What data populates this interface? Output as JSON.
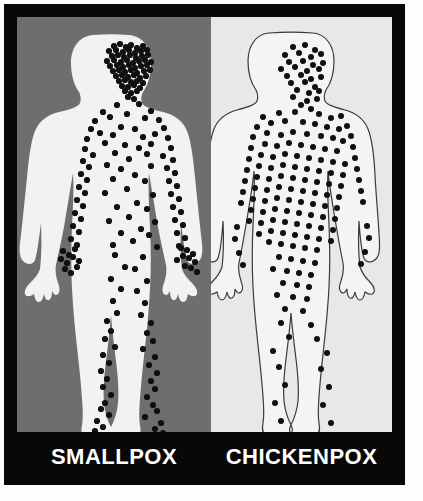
{
  "figure": {
    "type": "comparison-illustration",
    "title_visible": false,
    "panels": [
      {
        "id": "smallpox",
        "label": "SMALLPOX",
        "background_color": "#6e6e6e",
        "body_fill": "#f2f2f2",
        "body_stroke": "none",
        "spot_color": "#101010",
        "rash_distribution": "centrifugal - dense on face, hands, lower legs and feet; sparser on trunk",
        "spot_count": 186
      },
      {
        "id": "chickenpox",
        "label": "CHICKENPOX",
        "background_color": "#e8e8e8",
        "body_fill": "#f4f4f4",
        "body_stroke": "#3a3a3a",
        "spot_color": "#101010",
        "rash_distribution": "centripetal - dense on trunk and face; sparse on limbs, almost none on hands and feet",
        "spot_count": 151
      }
    ],
    "frame_color": "#080808",
    "label_text_color": "#ffffff",
    "outer_background": "#ffffff"
  },
  "chart_data": {
    "type": "table",
    "categories": [
      "Head/Face",
      "Trunk",
      "Arms",
      "Hands",
      "Legs",
      "Feet"
    ],
    "series": [
      {
        "name": "SMALLPOX",
        "values": [
          48,
          34,
          40,
          26,
          30,
          18
        ]
      },
      {
        "name": "CHICKENPOX",
        "values": [
          30,
          96,
          14,
          4,
          6,
          1
        ]
      }
    ],
    "xlabel": "Body region",
    "ylabel": "Number of lesions depicted",
    "legend": [
      "SMALLPOX",
      "CHICKENPOX"
    ]
  },
  "smallpox_spots": [
    [
      97,
      29
    ],
    [
      103,
      27
    ],
    [
      109,
      30
    ],
    [
      114,
      28
    ],
    [
      120,
      31
    ],
    [
      126,
      29
    ],
    [
      92,
      34
    ],
    [
      99,
      33
    ],
    [
      106,
      35
    ],
    [
      112,
      33
    ],
    [
      118,
      36
    ],
    [
      124,
      34
    ],
    [
      130,
      33
    ],
    [
      95,
      39
    ],
    [
      101,
      38
    ],
    [
      107,
      40
    ],
    [
      113,
      38
    ],
    [
      119,
      41
    ],
    [
      125,
      39
    ],
    [
      131,
      38
    ],
    [
      90,
      44
    ],
    [
      97,
      43
    ],
    [
      104,
      45
    ],
    [
      110,
      43
    ],
    [
      116,
      46
    ],
    [
      122,
      44
    ],
    [
      128,
      43
    ],
    [
      134,
      45
    ],
    [
      93,
      49
    ],
    [
      100,
      48
    ],
    [
      106,
      50
    ],
    [
      112,
      48
    ],
    [
      118,
      51
    ],
    [
      124,
      49
    ],
    [
      130,
      48
    ],
    [
      96,
      54
    ],
    [
      102,
      53
    ],
    [
      108,
      55
    ],
    [
      114,
      53
    ],
    [
      120,
      56
    ],
    [
      127,
      54
    ],
    [
      133,
      53
    ],
    [
      99,
      59
    ],
    [
      105,
      58
    ],
    [
      111,
      60
    ],
    [
      117,
      58
    ],
    [
      123,
      61
    ],
    [
      129,
      59
    ],
    [
      102,
      64
    ],
    [
      108,
      63
    ],
    [
      114,
      65
    ],
    [
      120,
      64
    ],
    [
      126,
      66
    ],
    [
      105,
      69
    ],
    [
      111,
      70
    ],
    [
      117,
      68
    ],
    [
      123,
      71
    ],
    [
      108,
      74
    ],
    [
      114,
      76
    ],
    [
      120,
      74
    ],
    [
      111,
      80
    ],
    [
      117,
      82
    ],
    [
      100,
      88
    ],
    [
      122,
      87
    ],
    [
      86,
      95
    ],
    [
      134,
      94
    ],
    [
      78,
      104
    ],
    [
      142,
      103
    ],
    [
      93,
      100
    ],
    [
      128,
      101
    ],
    [
      110,
      97
    ],
    [
      74,
      112
    ],
    [
      147,
      111
    ],
    [
      83,
      116
    ],
    [
      138,
      117
    ],
    [
      70,
      122
    ],
    [
      151,
      121
    ],
    [
      104,
      110
    ],
    [
      118,
      112
    ],
    [
      96,
      118
    ],
    [
      126,
      120
    ],
    [
      88,
      126
    ],
    [
      134,
      127
    ],
    [
      68,
      132
    ],
    [
      154,
      131
    ],
    [
      76,
      138
    ],
    [
      146,
      139
    ],
    [
      108,
      128
    ],
    [
      122,
      131
    ],
    [
      98,
      136
    ],
    [
      130,
      137
    ],
    [
      66,
      144
    ],
    [
      156,
      143
    ],
    [
      72,
      150
    ],
    [
      150,
      151
    ],
    [
      112,
      142
    ],
    [
      90,
      148
    ],
    [
      134,
      149
    ],
    [
      104,
      152
    ],
    [
      64,
      157
    ],
    [
      158,
      156
    ],
    [
      70,
      163
    ],
    [
      152,
      164
    ],
    [
      118,
      158
    ],
    [
      96,
      162
    ],
    [
      128,
      164
    ],
    [
      62,
      170
    ],
    [
      160,
      169
    ],
    [
      68,
      176
    ],
    [
      154,
      177
    ],
    [
      110,
      172
    ],
    [
      88,
      176
    ],
    [
      136,
      178
    ],
    [
      60,
      183
    ],
    [
      162,
      182
    ],
    [
      66,
      189
    ],
    [
      156,
      190
    ],
    [
      120,
      186
    ],
    [
      100,
      190
    ],
    [
      130,
      192
    ],
    [
      58,
      196
    ],
    [
      164,
      195
    ],
    [
      64,
      202
    ],
    [
      158,
      203
    ],
    [
      112,
      200
    ],
    [
      92,
      204
    ],
    [
      138,
      205
    ],
    [
      56,
      209
    ],
    [
      166,
      208
    ],
    [
      62,
      215
    ],
    [
      160,
      216
    ],
    [
      124,
      212
    ],
    [
      104,
      216
    ],
    [
      132,
      218
    ],
    [
      54,
      222
    ],
    [
      168,
      221
    ],
    [
      60,
      228
    ],
    [
      162,
      229
    ],
    [
      116,
      224
    ],
    [
      96,
      228
    ],
    [
      140,
      230
    ],
    [
      46,
      234
    ],
    [
      52,
      238
    ],
    [
      58,
      232
    ],
    [
      44,
      242
    ],
    [
      50,
      246
    ],
    [
      56,
      240
    ],
    [
      62,
      244
    ],
    [
      48,
      252
    ],
    [
      54,
      256
    ],
    [
      60,
      250
    ],
    [
      170,
      233
    ],
    [
      176,
      237
    ],
    [
      164,
      231
    ],
    [
      172,
      241
    ],
    [
      178,
      245
    ],
    [
      166,
      239
    ],
    [
      160,
      243
    ],
    [
      174,
      251
    ],
    [
      180,
      255
    ],
    [
      168,
      249
    ],
    [
      98,
      238
    ],
    [
      126,
      240
    ],
    [
      108,
      250
    ],
    [
      118,
      252
    ],
    [
      94,
      262
    ],
    [
      130,
      264
    ],
    [
      104,
      272
    ],
    [
      120,
      274
    ],
    [
      96,
      284
    ],
    [
      128,
      286
    ],
    [
      100,
      296
    ],
    [
      124,
      298
    ],
    [
      90,
      304
    ],
    [
      134,
      306
    ],
    [
      94,
      314
    ],
    [
      130,
      316
    ],
    [
      88,
      322
    ],
    [
      136,
      324
    ],
    [
      98,
      330
    ],
    [
      126,
      332
    ],
    [
      86,
      338
    ],
    [
      138,
      340
    ],
    [
      92,
      346
    ],
    [
      132,
      348
    ],
    [
      84,
      354
    ],
    [
      140,
      356
    ],
    [
      90,
      362
    ],
    [
      134,
      364
    ],
    [
      86,
      370
    ],
    [
      138,
      372
    ],
    [
      94,
      378
    ],
    [
      130,
      380
    ],
    [
      88,
      386
    ],
    [
      136,
      388
    ],
    [
      84,
      392
    ],
    [
      140,
      394
    ],
    [
      92,
      398
    ],
    [
      128,
      400
    ],
    [
      80,
      404
    ],
    [
      144,
      406
    ],
    [
      86,
      410
    ],
    [
      138,
      412
    ],
    [
      78,
      414
    ],
    [
      146,
      416
    ],
    [
      90,
      418
    ],
    [
      134,
      420
    ],
    [
      82,
      422
    ],
    [
      142,
      424
    ]
  ],
  "chickenpox_spots": [
    [
      70,
      30
    ],
    [
      82,
      28
    ],
    [
      92,
      33
    ],
    [
      62,
      38
    ],
    [
      76,
      36
    ],
    [
      88,
      40
    ],
    [
      98,
      37
    ],
    [
      66,
      45
    ],
    [
      80,
      44
    ],
    [
      90,
      48
    ],
    [
      100,
      46
    ],
    [
      58,
      52
    ],
    [
      72,
      50
    ],
    [
      84,
      54
    ],
    [
      96,
      52
    ],
    [
      64,
      59
    ],
    [
      78,
      58
    ],
    [
      88,
      62
    ],
    [
      98,
      60
    ],
    [
      68,
      66
    ],
    [
      82,
      65
    ],
    [
      92,
      70
    ],
    [
      74,
      73
    ],
    [
      86,
      76
    ],
    [
      96,
      74
    ],
    [
      70,
      80
    ],
    [
      84,
      84
    ],
    [
      94,
      82
    ],
    [
      78,
      88
    ],
    [
      88,
      92
    ],
    [
      40,
      100
    ],
    [
      118,
      99
    ],
    [
      56,
      96
    ],
    [
      72,
      95
    ],
    [
      96,
      97
    ],
    [
      108,
      101
    ],
    [
      34,
      110
    ],
    [
      124,
      109
    ],
    [
      48,
      106
    ],
    [
      62,
      104
    ],
    [
      80,
      105
    ],
    [
      92,
      107
    ],
    [
      104,
      110
    ],
    [
      116,
      112
    ],
    [
      30,
      120
    ],
    [
      128,
      119
    ],
    [
      44,
      116
    ],
    [
      58,
      118
    ],
    [
      70,
      115
    ],
    [
      84,
      117
    ],
    [
      98,
      119
    ],
    [
      110,
      121
    ],
    [
      120,
      124
    ],
    [
      28,
      131
    ],
    [
      130,
      130
    ],
    [
      42,
      127
    ],
    [
      54,
      129
    ],
    [
      66,
      126
    ],
    [
      78,
      128
    ],
    [
      90,
      130
    ],
    [
      102,
      132
    ],
    [
      114,
      134
    ],
    [
      26,
      142
    ],
    [
      132,
      141
    ],
    [
      38,
      138
    ],
    [
      50,
      140
    ],
    [
      62,
      137
    ],
    [
      74,
      139
    ],
    [
      86,
      141
    ],
    [
      98,
      143
    ],
    [
      110,
      145
    ],
    [
      122,
      147
    ],
    [
      24,
      153
    ],
    [
      134,
      152
    ],
    [
      36,
      149
    ],
    [
      48,
      151
    ],
    [
      60,
      148
    ],
    [
      72,
      150
    ],
    [
      84,
      152
    ],
    [
      96,
      154
    ],
    [
      108,
      156
    ],
    [
      120,
      158
    ],
    [
      22,
      164
    ],
    [
      136,
      163
    ],
    [
      34,
      160
    ],
    [
      46,
      162
    ],
    [
      58,
      159
    ],
    [
      70,
      161
    ],
    [
      82,
      163
    ],
    [
      94,
      165
    ],
    [
      106,
      167
    ],
    [
      118,
      169
    ],
    [
      20,
      175
    ],
    [
      138,
      174
    ],
    [
      32,
      171
    ],
    [
      44,
      173
    ],
    [
      56,
      170
    ],
    [
      68,
      172
    ],
    [
      80,
      174
    ],
    [
      92,
      176
    ],
    [
      104,
      178
    ],
    [
      116,
      180
    ],
    [
      18,
      186
    ],
    [
      140,
      185
    ],
    [
      30,
      182
    ],
    [
      42,
      184
    ],
    [
      54,
      181
    ],
    [
      66,
      183
    ],
    [
      78,
      185
    ],
    [
      90,
      187
    ],
    [
      102,
      189
    ],
    [
      114,
      191
    ],
    [
      28,
      193
    ],
    [
      40,
      195
    ],
    [
      52,
      192
    ],
    [
      64,
      194
    ],
    [
      76,
      196
    ],
    [
      88,
      198
    ],
    [
      100,
      200
    ],
    [
      112,
      202
    ],
    [
      26,
      204
    ],
    [
      38,
      206
    ],
    [
      50,
      203
    ],
    [
      62,
      205
    ],
    [
      74,
      207
    ],
    [
      86,
      209
    ],
    [
      98,
      211
    ],
    [
      110,
      213
    ],
    [
      36,
      217
    ],
    [
      48,
      214
    ],
    [
      60,
      216
    ],
    [
      72,
      218
    ],
    [
      84,
      220
    ],
    [
      96,
      222
    ],
    [
      108,
      224
    ],
    [
      46,
      225
    ],
    [
      58,
      227
    ],
    [
      70,
      229
    ],
    [
      82,
      231
    ],
    [
      94,
      233
    ],
    [
      14,
      210
    ],
    [
      144,
      209
    ],
    [
      12,
      222
    ],
    [
      146,
      221
    ],
    [
      56,
      240
    ],
    [
      68,
      242
    ],
    [
      80,
      244
    ],
    [
      92,
      246
    ],
    [
      50,
      252
    ],
    [
      64,
      254
    ],
    [
      76,
      256
    ],
    [
      88,
      258
    ],
    [
      60,
      266
    ],
    [
      74,
      268
    ],
    [
      86,
      270
    ],
    [
      54,
      278
    ],
    [
      70,
      280
    ],
    [
      84,
      282
    ],
    [
      16,
      236
    ],
    [
      142,
      235
    ],
    [
      20,
      248
    ],
    [
      138,
      247
    ],
    [
      62,
      292
    ],
    [
      80,
      294
    ],
    [
      58,
      306
    ],
    [
      88,
      308
    ],
    [
      66,
      320
    ],
    [
      94,
      322
    ],
    [
      50,
      334
    ],
    [
      104,
      336
    ],
    [
      56,
      350
    ],
    [
      98,
      352
    ],
    [
      62,
      368
    ],
    [
      106,
      370
    ],
    [
      52,
      386
    ],
    [
      100,
      388
    ],
    [
      58,
      404
    ],
    [
      108,
      406
    ]
  ]
}
